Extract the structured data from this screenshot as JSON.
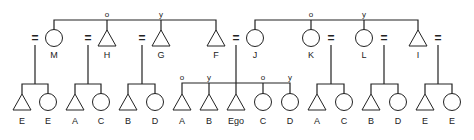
{
  "diagram": {
    "type": "kinship-chart",
    "colors": {
      "line": "#222222",
      "background": "#ffffff"
    },
    "generation1": {
      "left_sibling_group": [
        {
          "id": "M",
          "label": "M",
          "sex": "female",
          "birth_order": ""
        },
        {
          "id": "H",
          "label": "H",
          "sex": "male",
          "birth_order": "o"
        },
        {
          "id": "G",
          "label": "G",
          "sex": "male",
          "birth_order": "y"
        },
        {
          "id": "F",
          "label": "F",
          "sex": "male",
          "birth_order": ""
        }
      ],
      "right_sibling_group": [
        {
          "id": "J",
          "label": "J",
          "sex": "female",
          "birth_order": ""
        },
        {
          "id": "K",
          "label": "K",
          "sex": "female",
          "birth_order": "o"
        },
        {
          "id": "L",
          "label": "L",
          "sex": "female",
          "birth_order": "y"
        },
        {
          "id": "I",
          "label": "I",
          "sex": "male",
          "birth_order": ""
        }
      ]
    },
    "marriage_symbol": "=",
    "generation2": [
      {
        "parents": "M",
        "children": [
          {
            "label": "E",
            "sex": "male"
          },
          {
            "label": "E",
            "sex": "female"
          }
        ]
      },
      {
        "parents": "H",
        "children": [
          {
            "label": "A",
            "sex": "male"
          },
          {
            "label": "C",
            "sex": "female"
          }
        ]
      },
      {
        "parents": "G",
        "children": [
          {
            "label": "B",
            "sex": "male"
          },
          {
            "label": "D",
            "sex": "female"
          }
        ]
      },
      {
        "parents": "F=J",
        "children": [
          {
            "label": "A",
            "sex": "male",
            "birth_order": "o"
          },
          {
            "label": "B",
            "sex": "male",
            "birth_order": "y"
          },
          {
            "label": "Ego",
            "sex": "male",
            "birth_order": ""
          },
          {
            "label": "C",
            "sex": "female",
            "birth_order": "o"
          },
          {
            "label": "D",
            "sex": "female",
            "birth_order": "y"
          }
        ]
      },
      {
        "parents": "K",
        "children": [
          {
            "label": "A",
            "sex": "male"
          },
          {
            "label": "C",
            "sex": "female"
          }
        ]
      },
      {
        "parents": "L",
        "children": [
          {
            "label": "B",
            "sex": "male"
          },
          {
            "label": "D",
            "sex": "female"
          }
        ]
      },
      {
        "parents": "I",
        "children": [
          {
            "label": "E",
            "sex": "male"
          },
          {
            "label": "E",
            "sex": "female"
          }
        ]
      }
    ],
    "labels": {
      "g1": [
        "M",
        "H",
        "G",
        "F",
        "J",
        "K",
        "L",
        "I"
      ],
      "g1_order": [
        "o",
        "y",
        "o",
        "y"
      ],
      "g2": [
        "E",
        "E",
        "A",
        "C",
        "B",
        "D",
        "A",
        "B",
        "Ego",
        "C",
        "D",
        "A",
        "C",
        "B",
        "D",
        "E",
        "E"
      ],
      "g2_order": [
        "o",
        "y",
        "o",
        "y"
      ],
      "eq": "="
    }
  }
}
